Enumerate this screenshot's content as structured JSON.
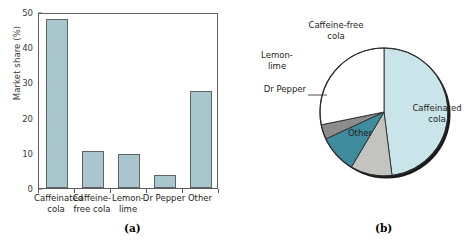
{
  "figure": {
    "panel_a_letter": "(a)",
    "panel_b_letter": "(b)",
    "caption_partial": "a for the soft-drink market. Market s"
  },
  "chart_data": [
    {
      "type": "bar",
      "title": "",
      "xlabel": "",
      "ylabel": "Market share (%)",
      "categories": [
        "Caffeinated cola",
        "Caffeine-free cola",
        "Lemon-lime",
        "Dr Pepper",
        "Other"
      ],
      "category_lines": [
        [
          "Caffeinated",
          "cola"
        ],
        [
          "Caffeine-",
          "free cola"
        ],
        [
          "Lemon-",
          "lime"
        ],
        [
          "Dr Pepper"
        ],
        [
          "Other"
        ]
      ],
      "values": [
        48.0,
        10.5,
        9.6,
        3.7,
        27.6
      ],
      "ylim": [
        0,
        50
      ],
      "yticks": [
        0,
        10,
        20,
        30,
        40,
        50
      ],
      "ytick_labels": [
        "0",
        "10",
        "20",
        "30",
        "40",
        "50"
      ],
      "grid": false,
      "legend": "none",
      "bar_fill": "#a9c6cf",
      "bar_edge": "#5b6366"
    },
    {
      "type": "pie",
      "title": "",
      "labels": [
        "Caffeinated cola",
        "Caffeine-free cola",
        "Lemon-lime",
        "Dr Pepper",
        "Other"
      ],
      "label_lines": [
        [
          "Caffeinated",
          "cola"
        ],
        [
          "Caffeine-free",
          "cola"
        ],
        [
          "Lemon-",
          "lime"
        ],
        [
          "Dr Pepper"
        ],
        [
          "Other"
        ]
      ],
      "values": [
        48.0,
        10.5,
        9.6,
        3.7,
        28.2
      ],
      "colors": [
        "#c9e5ea",
        "#c3c3c0",
        "#3f8c9e",
        "#8c8c8c",
        "#ffffff"
      ],
      "start_angle_deg": 0,
      "direction": "clockwise",
      "legend": "labels-outside"
    }
  ]
}
